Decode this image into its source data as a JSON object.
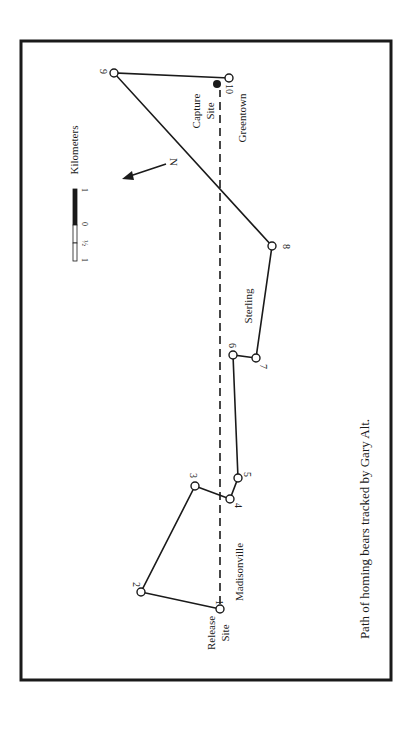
{
  "figure": {
    "caption": "Path of homing bears tracked by Gary Alt.",
    "colors": {
      "ink": "#1a1a1a",
      "background": "#ffffff"
    }
  },
  "scale_bar": {
    "title": "Kilometers",
    "ticks": [
      "1",
      "½",
      "0",
      "1"
    ]
  },
  "north_arrow": {
    "label": "N"
  },
  "route": {
    "points": [
      {
        "id": "1",
        "label": "1",
        "x": 220,
        "y": 609
      },
      {
        "id": "2",
        "label": "2",
        "x": 141,
        "y": 592
      },
      {
        "id": "3",
        "label": "3",
        "x": 195,
        "y": 486
      },
      {
        "id": "4",
        "label": "4",
        "x": 230,
        "y": 499
      },
      {
        "id": "5",
        "label": "5",
        "x": 238,
        "y": 478
      },
      {
        "id": "6",
        "label": "6",
        "x": 233,
        "y": 355
      },
      {
        "id": "7",
        "label": "7",
        "x": 256,
        "y": 358
      },
      {
        "id": "8",
        "label": "8",
        "x": 272,
        "y": 246
      },
      {
        "id": "9",
        "label": "9",
        "x": 114,
        "y": 73
      },
      {
        "id": "10",
        "label": "10",
        "x": 229,
        "y": 78
      }
    ]
  },
  "places": {
    "release_site_line1": "Release",
    "release_site_line2": "Site",
    "capture_site_line1": "Capture",
    "capture_site_line2": "Site",
    "madisonville": "Madisonville",
    "sterling": "Sterling",
    "greentown": "Greentown"
  }
}
